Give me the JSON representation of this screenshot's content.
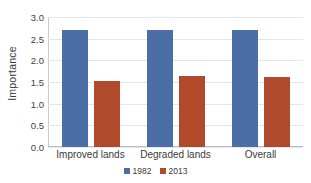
{
  "chart_data": {
    "type": "bar",
    "title": "",
    "xlabel": "",
    "ylabel": "Importance",
    "categories": [
      "Improved lands",
      "Degraded lands",
      "Overall"
    ],
    "series": [
      {
        "name": "1982",
        "color": "#4a6ea5",
        "values": [
          2.7,
          2.7,
          2.7
        ]
      },
      {
        "name": "2013",
        "color": "#b04a2c",
        "values": [
          1.53,
          1.65,
          1.62
        ]
      }
    ],
    "ylim": [
      0.0,
      3.0
    ],
    "ytick_labels": [
      "3.0",
      "2.5",
      "2.0",
      "1.5",
      "1.0",
      "0.5",
      "0.0"
    ],
    "ytick_values": [
      3.0,
      2.5,
      2.0,
      1.5,
      1.0,
      0.5,
      0.0
    ],
    "grid": "horizontal",
    "legend_position": "bottom"
  }
}
